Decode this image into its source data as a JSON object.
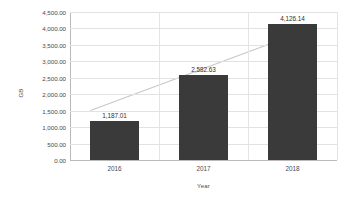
{
  "chart_data": {
    "type": "bar",
    "title": "",
    "subtitle": "",
    "xlabel": "Year",
    "ylabel": "GB",
    "categories": [
      "2016",
      "2017",
      "2018"
    ],
    "values": [
      1187.01,
      2582.63,
      4126.14
    ],
    "data_labels": [
      "1,187.01",
      "2,582.63",
      "4,126.14"
    ],
    "ylim": [
      0,
      4500
    ],
    "ytick_values": [
      0,
      500,
      1000,
      1500,
      2000,
      2500,
      3000,
      3500,
      4000,
      4500
    ],
    "ytick_labels": [
      "0.00",
      "500.00",
      "1,000.00",
      "1,500.00",
      "2,000.00",
      "2,500.00",
      "3,000.00",
      "3,500.00",
      "4,000.00",
      "4,500.00"
    ],
    "grid": {
      "horizontal": true,
      "vertical": true
    },
    "legend": {
      "visible": false,
      "position": "none"
    },
    "series": [
      {
        "name": "GB",
        "type": "bar",
        "values": [
          1187.01,
          2582.63,
          4126.14
        ],
        "color": "#3a3a3a"
      },
      {
        "name": "Trendline",
        "type": "line",
        "values": [
          1504,
          2582.63,
          4013
        ],
        "color": "#c7c7c7"
      }
    ],
    "colors": {
      "bar": "#3a3a3a",
      "trendline": "#c7c7c7",
      "gridline": "#e2e2e2",
      "axis": "#b9b9b9",
      "text": "#4a4a4a",
      "background": "#ffffff"
    }
  }
}
